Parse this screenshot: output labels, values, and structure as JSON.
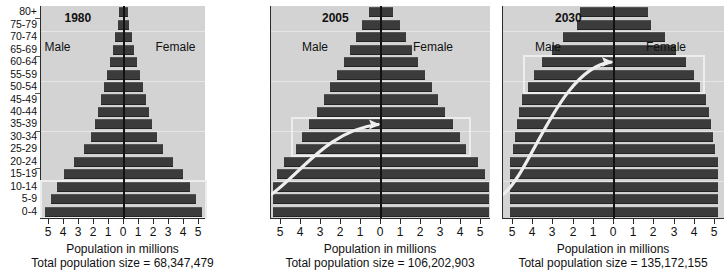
{
  "figure": {
    "age_groups": [
      "80+",
      "75-79",
      "70-74",
      "65-69",
      "60-64",
      "55-59",
      "50-54",
      "45-49",
      "40-44",
      "35-39",
      "30-34",
      "25-29",
      "20-24",
      "15-19",
      "10-14",
      "5-9",
      "0-4"
    ],
    "xlabel": "Population in millions",
    "tick_labels": [
      "5",
      "4",
      "3",
      "2",
      "1",
      "0",
      "1",
      "2",
      "3",
      "4",
      "5"
    ],
    "male_label": "Male",
    "female_label": "Female",
    "bar_color": "#3b3b3b",
    "plot_bg": "#d3d3d3",
    "axis_color": "#2b2b2b",
    "caption": ""
  },
  "chart_data": {
    "type": "bar",
    "xlabel": "Population in millions",
    "ylabel": "Age group",
    "xlim": [
      -5.5,
      5.5
    ],
    "grid": true,
    "legend": [
      "Male",
      "Female"
    ],
    "categories": [
      "0-4",
      "5-9",
      "10-14",
      "15-19",
      "20-24",
      "25-29",
      "30-34",
      "35-39",
      "40-44",
      "45-49",
      "50-54",
      "55-59",
      "60-64",
      "65-69",
      "70-74",
      "75-79",
      "80+"
    ],
    "panels": [
      {
        "year": "1980",
        "total_label": "Total population size = 68,347,479",
        "total_population": 68347479,
        "male": [
          5.25,
          4.85,
          4.45,
          3.95,
          3.3,
          2.65,
          2.2,
          1.9,
          1.7,
          1.5,
          1.3,
          1.1,
          0.9,
          0.72,
          0.55,
          0.38,
          0.28
        ],
        "female": [
          5.25,
          4.85,
          4.45,
          3.95,
          3.3,
          2.65,
          2.2,
          1.9,
          1.7,
          1.5,
          1.3,
          1.1,
          0.9,
          0.72,
          0.55,
          0.38,
          0.28
        ],
        "highlight_groups": [
          "0-4",
          "5-9",
          "10-14"
        ]
      },
      {
        "year": "2005",
        "total_label": "Total population size = 106,202,903",
        "total_population": 106202903,
        "male": [
          5.4,
          5.4,
          5.4,
          5.2,
          4.85,
          4.25,
          3.95,
          3.6,
          3.2,
          2.85,
          2.55,
          2.2,
          1.85,
          1.55,
          1.25,
          0.95,
          0.6
        ],
        "female": [
          5.4,
          5.4,
          5.4,
          5.2,
          4.85,
          4.25,
          3.95,
          3.6,
          3.2,
          2.85,
          2.55,
          2.2,
          1.85,
          1.55,
          1.25,
          0.95,
          0.6
        ],
        "highlight_groups": [
          "25-29",
          "30-34",
          "35-39"
        ]
      },
      {
        "year": "2030",
        "total_label": "Total population size = 135,172,155",
        "total_population": 135172155,
        "male": [
          5.15,
          5.15,
          5.15,
          5.15,
          5.15,
          5.0,
          4.9,
          4.8,
          4.7,
          4.55,
          4.25,
          3.95,
          3.55,
          3.05,
          2.55,
          1.85,
          1.7
        ],
        "female": [
          5.15,
          5.15,
          5.15,
          5.15,
          5.15,
          5.0,
          4.9,
          4.8,
          4.7,
          4.55,
          4.25,
          3.95,
          3.55,
          3.05,
          2.55,
          1.85,
          1.7
        ],
        "highlight_groups": [
          "50-54",
          "55-59",
          "60-64"
        ]
      }
    ],
    "annotations": [
      {
        "type": "arrow",
        "panel": "2005",
        "description": "cohort arrow sweeping from lower-left to the 30-34 band"
      },
      {
        "type": "arrow",
        "panel": "2030",
        "description": "cohort arrow sweeping from lower-left to the 55-59 band"
      }
    ]
  }
}
